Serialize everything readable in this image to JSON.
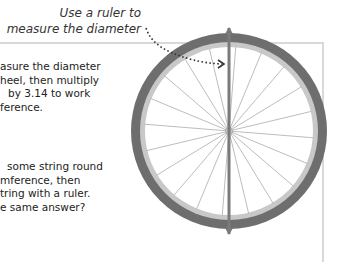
{
  "callout": {
    "line1": "Use a ruler to",
    "line2": "measure the diameter"
  },
  "paragraph1": {
    "lines": [
      "asure the diameter",
      "heel, then multiply",
      "by 3.14 to work",
      "ference."
    ]
  },
  "paragraph2": {
    "lines": [
      "some string round",
      "mference, then",
      "tring with a ruler.",
      "e same answer?"
    ]
  },
  "wheel": {
    "spoke_count": 20,
    "colors": {
      "tyre": "#6e6e6e",
      "rim": "#c8c8c8",
      "spoke": "#bdbdbd",
      "diameter_rod": "#7a7a7a",
      "frame": "#d9d9d9"
    }
  }
}
